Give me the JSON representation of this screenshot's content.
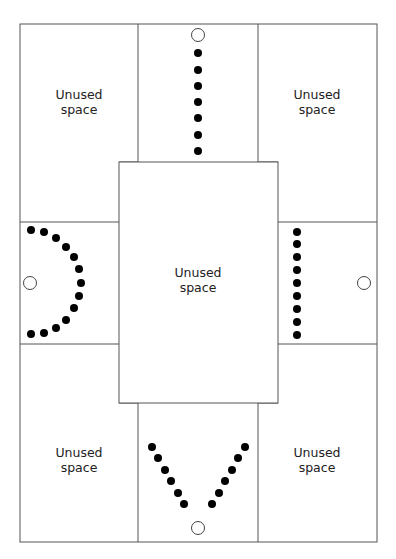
{
  "diagram": {
    "type": "floor-layout",
    "line_color": "#555555",
    "dot_color": "#000000",
    "outer_border": {
      "x": 20,
      "y": 24,
      "w": 357,
      "h": 518
    },
    "center_rect": {
      "x": 119,
      "y": 162,
      "w": 159,
      "h": 241
    },
    "grid_lines": {
      "vertical_top": [
        138,
        258
      ],
      "vertical_bottom": [
        138,
        258
      ],
      "horizontal_left": [
        222,
        344
      ],
      "horizontal_right": [
        222,
        344
      ],
      "top_row_bottom": 162,
      "bottom_row_top": 403
    },
    "labels": {
      "top_left": {
        "line1": "Unused",
        "line2": "space"
      },
      "top_right": {
        "line1": "Unused",
        "line2": "space"
      },
      "center": {
        "line1": "Unused",
        "line2": "space"
      },
      "bottom_left": {
        "line1": "Unused",
        "line2": "space"
      },
      "bottom_right": {
        "line1": "Unused",
        "line2": "space"
      }
    },
    "sections": {
      "top": {
        "description": "straight line of seats facing open circle",
        "open_circle": {
          "x": 198,
          "y": 35
        },
        "dots": [
          [
            198,
            53
          ],
          [
            198,
            70
          ],
          [
            198,
            86
          ],
          [
            198,
            102
          ],
          [
            198,
            118
          ],
          [
            198,
            135
          ],
          [
            198,
            151
          ]
        ]
      },
      "left": {
        "description": "arc of seats around open circle",
        "open_circle": {
          "x": 30,
          "y": 283
        },
        "dots": [
          [
            31,
            230
          ],
          [
            44,
            232
          ],
          [
            56,
            238
          ],
          [
            66,
            247
          ],
          [
            74,
            257
          ],
          [
            79,
            269
          ],
          [
            81,
            283
          ],
          [
            79,
            296
          ],
          [
            74,
            308
          ],
          [
            66,
            320
          ],
          [
            56,
            328
          ],
          [
            44,
            333
          ],
          [
            31,
            334
          ]
        ]
      },
      "right": {
        "description": "straight column of seats facing open circle",
        "open_circle": {
          "x": 364,
          "y": 283
        },
        "dots": [
          [
            297,
            232
          ],
          [
            297,
            244
          ],
          [
            297,
            257
          ],
          [
            297,
            270
          ],
          [
            297,
            283
          ],
          [
            297,
            296
          ],
          [
            297,
            309
          ],
          [
            297,
            322
          ],
          [
            297,
            335
          ]
        ]
      },
      "bottom": {
        "description": "V-shaped arrangement of seats facing open circle",
        "open_circle": {
          "x": 198,
          "y": 528
        },
        "dots": [
          [
            152,
            447
          ],
          [
            158,
            458
          ],
          [
            165,
            470
          ],
          [
            171,
            481
          ],
          [
            178,
            493
          ],
          [
            184,
            504
          ],
          [
            245,
            447
          ],
          [
            238,
            458
          ],
          [
            232,
            470
          ],
          [
            225,
            481
          ],
          [
            219,
            493
          ],
          [
            212,
            504
          ]
        ]
      }
    }
  }
}
